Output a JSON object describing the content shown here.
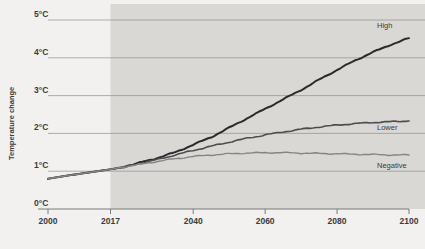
{
  "chart_data": {
    "type": "line",
    "title": "",
    "subtitle": "",
    "xlabel": "",
    "ylabel": "Temperature change",
    "xlim": [
      2000,
      2100
    ],
    "ylim": [
      0,
      5
    ],
    "grid": true,
    "legend_position": "right-inline",
    "x_tick_labels": [
      "2000",
      "2017",
      "2040",
      "2060",
      "2080",
      "2100"
    ],
    "x_tick_values": [
      2000,
      2017,
      2040,
      2060,
      2080,
      2100
    ],
    "y_tick_labels": [
      "0°C",
      "1°C",
      "2°C",
      "3°C",
      "4°C",
      "5°C"
    ],
    "y_tick_values": [
      0,
      1,
      2,
      3,
      4,
      5
    ],
    "shaded_region": {
      "label": "",
      "from": 2017,
      "to": 2100,
      "color": "#d9d8d5"
    },
    "x": [
      2000,
      2005,
      2010,
      2017,
      2020,
      2025,
      2030,
      2035,
      2040,
      2045,
      2050,
      2055,
      2060,
      2065,
      2070,
      2075,
      2080,
      2085,
      2090,
      2095,
      2100
    ],
    "series": [
      {
        "name": "High",
        "color": "#2b2b2b",
        "width": 2.0,
        "label": "High",
        "label_value": "4.5",
        "values": [
          0.8,
          0.88,
          0.95,
          1.05,
          1.1,
          1.22,
          1.35,
          1.5,
          1.7,
          1.9,
          2.15,
          2.4,
          2.65,
          2.9,
          3.15,
          3.42,
          3.68,
          3.93,
          4.15,
          4.35,
          4.52
        ]
      },
      {
        "name": "Lower",
        "color": "#4d4d4d",
        "width": 1.6,
        "label": "Lower",
        "label_value": "2.3",
        "values": [
          0.8,
          0.88,
          0.95,
          1.05,
          1.1,
          1.2,
          1.31,
          1.43,
          1.55,
          1.66,
          1.77,
          1.87,
          1.96,
          2.04,
          2.11,
          2.17,
          2.22,
          2.26,
          2.29,
          2.31,
          2.33
        ]
      },
      {
        "name": "Negative",
        "color": "#848486",
        "width": 1.4,
        "label": "Negative",
        "label_value": "1.4",
        "values": [
          0.8,
          0.88,
          0.95,
          1.05,
          1.1,
          1.18,
          1.26,
          1.33,
          1.39,
          1.43,
          1.46,
          1.48,
          1.49,
          1.49,
          1.48,
          1.47,
          1.46,
          1.45,
          1.44,
          1.43,
          1.43
        ]
      }
    ]
  },
  "axis": {
    "y_title": "Temperature change"
  },
  "labels": {
    "high": "High",
    "lower": "Lower",
    "negative": "Negative"
  }
}
